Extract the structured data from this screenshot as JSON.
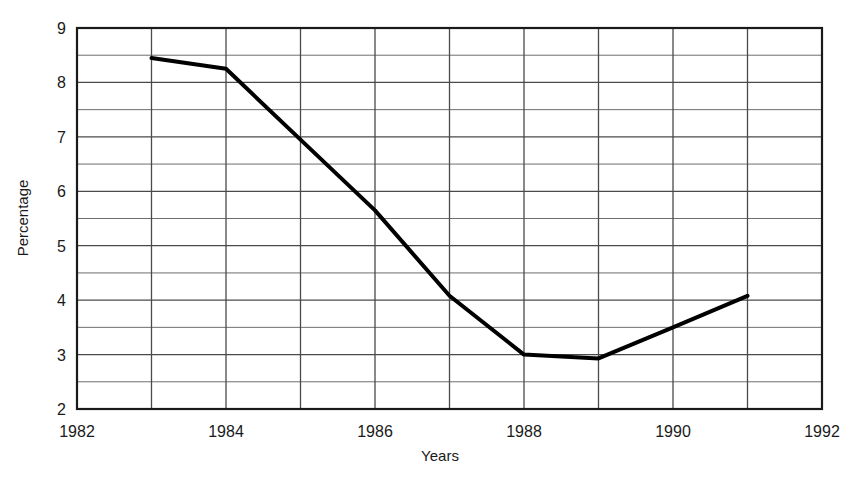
{
  "chart_data": {
    "type": "line",
    "title": "",
    "xlabel": "Years",
    "ylabel": "Percentage",
    "xlim": [
      1982,
      1992
    ],
    "ylim": [
      2,
      9
    ],
    "grid": true,
    "legend": "none",
    "x_major_ticks": [
      1982,
      1984,
      1986,
      1988,
      1990,
      1992
    ],
    "x_major_tick_labels": [
      "1982",
      "1984",
      "1986",
      "1988",
      "1990",
      "1992"
    ],
    "x_gridlines": [
      1982,
      1983,
      1984,
      1985,
      1986,
      1987,
      1988,
      1989,
      1990,
      1991,
      1992
    ],
    "y_major_ticks": [
      2,
      3,
      4,
      5,
      6,
      7,
      8,
      9
    ],
    "y_major_tick_labels": [
      "2",
      "3",
      "4",
      "5",
      "6",
      "7",
      "8",
      "9"
    ],
    "y_minor_gridlines": [
      2.5,
      3.5,
      4.5,
      5.5,
      6.5,
      7.5,
      8.5
    ],
    "series": [
      {
        "name": "Percentage",
        "color": "#000000",
        "line_width": 4,
        "x": [
          1983,
          1984,
          1985,
          1986,
          1987,
          1988,
          1989,
          1990,
          1991
        ],
        "values": [
          8.45,
          8.25,
          6.95,
          5.65,
          4.08,
          3.0,
          2.93,
          3.5,
          4.08
        ]
      }
    ]
  },
  "colors": {
    "background": "#ffffff",
    "line": "#000000",
    "axis": "#1a1a1a",
    "gridline_major": "#4a4a4a",
    "gridline_minor": "#6e6e6e",
    "text": "#1a1a1a"
  }
}
